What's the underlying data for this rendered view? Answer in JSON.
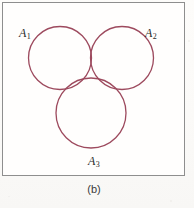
{
  "figure": {
    "caption": "(b)",
    "frame": {
      "border_color": "#8e8e8e",
      "background_color": "#fffefd"
    },
    "labels": {
      "a1": {
        "base": "A",
        "subscript": "1"
      },
      "a2": {
        "base": "A",
        "subscript": "2"
      },
      "a3": {
        "base": "A",
        "subscript": "3"
      }
    }
  },
  "chart_data": {
    "type": "diagram",
    "diagram_kind": "venn",
    "title": "",
    "subtitle": "",
    "caption": "(b)",
    "set_count": 3,
    "stroke_color": "#9d4a5e",
    "stroke_width": 1.3,
    "fill_color": "none",
    "shaded_fill_color": "#c79ca6",
    "shaded_region": "A1 ∩ A2 ∩ A3",
    "shaded_region_description": "triple intersection of all three sets",
    "sets": [
      {
        "name": "A1",
        "label_base": "A",
        "label_subscript": "1",
        "cx": 59,
        "cy": 57,
        "r": 31.5,
        "label_x": 16,
        "label_y": 24
      },
      {
        "name": "A2",
        "label_base": "A",
        "label_subscript": "2",
        "cx": 121,
        "cy": 57,
        "r": 31.5,
        "label_x": 142,
        "label_y": 24
      },
      {
        "name": "A3",
        "label_base": "A",
        "label_subscript": "3",
        "cx": 90,
        "cy": 112,
        "r": 35.0,
        "label_x": 85,
        "label_y": 152
      }
    ],
    "regions_shaded": [
      {
        "id": "A1A2A3",
        "sets": [
          "A1",
          "A2",
          "A3"
        ],
        "shaded": true
      }
    ],
    "xlabel": "",
    "ylabel": "",
    "grid": false,
    "legend": false
  }
}
